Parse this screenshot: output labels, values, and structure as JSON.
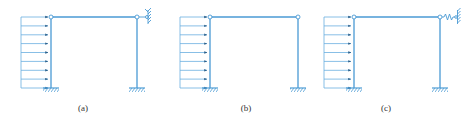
{
  "colors": {
    "frame": "#4a9ad4",
    "load": "#6aaee0",
    "arrowhead": "#2a5f8a",
    "support": "#4a9ad4",
    "hinge_fill": "#ffffff",
    "label": "#333333"
  },
  "panels": [
    {
      "id": "a",
      "label": "(a)",
      "right_support": "rotational-restraint-pin",
      "frame": {
        "left_x": 51,
        "right_x": 137,
        "top_y": 17,
        "base_y": 88
      },
      "load": {
        "x_start": 21,
        "x_end": 48,
        "arrow_count": 9
      }
    },
    {
      "id": "b",
      "label": "(b)",
      "right_support": "none",
      "frame": {
        "left_x": 210,
        "right_x": 298,
        "top_y": 17,
        "base_y": 88
      },
      "load": {
        "x_start": 180,
        "x_end": 207,
        "arrow_count": 9
      }
    },
    {
      "id": "c",
      "label": "(c)",
      "right_support": "spring",
      "frame": {
        "left_x": 354,
        "right_x": 440,
        "top_y": 17,
        "base_y": 88
      },
      "load": {
        "x_start": 324,
        "x_end": 351,
        "arrow_count": 9
      }
    }
  ]
}
